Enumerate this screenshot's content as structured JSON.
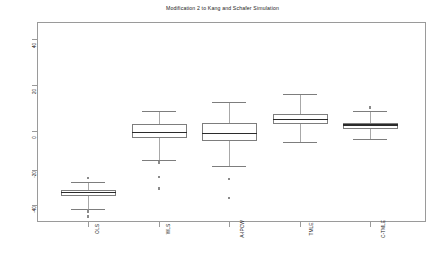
{
  "chart_data": {
    "type": "box",
    "title": "Modification 2 to Kang and Schafer Simulation",
    "xlabel": "",
    "ylabel": "",
    "ylim": [
      -47,
      47
    ],
    "yticks": [
      40,
      20,
      0,
      -20,
      -40
    ],
    "ytick_labels": [
      "40",
      "20",
      "0",
      "-20",
      "-40"
    ],
    "grid": false,
    "legend": "none",
    "categories": [
      "OLS",
      "WLS",
      "A-IPCW",
      "TMLE",
      "C-TMLE"
    ],
    "boxes": [
      {
        "name": "OLS",
        "whisker_low": -42.0,
        "q1": -35.6,
        "median": -34.0,
        "q3": -32.6,
        "whisker_high": -29.0,
        "outliers": [
          -27.0,
          -42.5,
          -43.5,
          -45.5
        ]
      },
      {
        "name": "WLS",
        "whisker_low": -18.5,
        "q1": -7.8,
        "median": -5.0,
        "q3": -1.0,
        "whisker_high": 5.5,
        "outliers": [
          -19.5,
          -26.5,
          -32.0
        ]
      },
      {
        "name": "A-IPCW",
        "whisker_low": -21.0,
        "q1": -9.3,
        "median": -5.5,
        "q3": -0.5,
        "whisker_high": 9.5,
        "outliers": [
          -27.5,
          -36.5
        ]
      },
      {
        "name": "TMLE",
        "whisker_low": -9.5,
        "q1": -1.0,
        "median": 1.2,
        "q3": 3.8,
        "whisker_high": 13.5,
        "outliers": []
      },
      {
        "name": "C-TMLE",
        "whisker_low": -8.0,
        "q1": -3.3,
        "median": -1.5,
        "q3": -0.4,
        "whisker_high": 5.2,
        "outliers": [
          6.7,
          7.1
        ]
      }
    ]
  },
  "axis": {
    "y_tick_0": "40",
    "y_tick_1": "20",
    "y_tick_2": "0",
    "y_tick_3": "-20",
    "y_tick_4": "-40"
  },
  "xlabels": {
    "l0": "OLS",
    "l1": "WLS",
    "l2": "A-IPCW",
    "l3": "TMLE",
    "l4": "C-TMLE"
  },
  "colors": {
    "frame": "#9a9a9a",
    "box_stroke": "#7d7d7d",
    "median": "#2b2b2b",
    "whisker": "#a8a8a8",
    "text": "#1a1a1a",
    "background": "#ffffff"
  }
}
